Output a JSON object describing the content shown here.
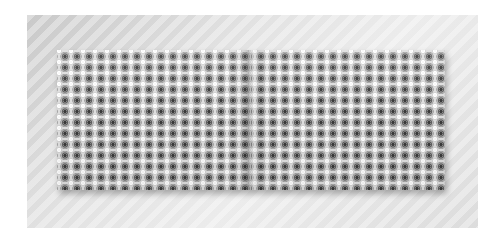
{
  "scene": {
    "description": "Open book mockup with repeating grayscale floral pattern on a striped light-gray backdrop",
    "backdrop": {
      "color_light": "#ececec",
      "color_dark": "#c9c9c9",
      "pattern": "diagonal-stripes"
    },
    "book": {
      "pages": [
        {
          "side": "left",
          "pattern": "floral-rosette-grid"
        },
        {
          "side": "right",
          "pattern": "floral-rosette-grid"
        }
      ],
      "pattern_colors": {
        "ink": "#3a3a3a",
        "mid": "#8a8a8a",
        "paper": "#dedede"
      }
    }
  }
}
